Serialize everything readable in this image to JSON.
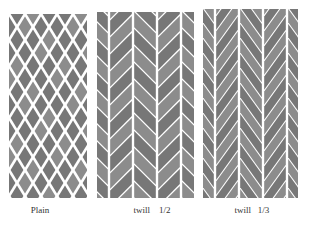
{
  "figure": {
    "panels": [
      {
        "id": "plain",
        "label": "Plain",
        "pattern": "diamond-lattice",
        "box": {
          "x": 9,
          "y": 14,
          "w": 78,
          "h": 184
        },
        "label_x": 40
      },
      {
        "id": "twill-1-2",
        "label": "twill    1/2",
        "pattern": "herringbone-short",
        "box": {
          "x": 97,
          "y": 12,
          "w": 97,
          "h": 186
        },
        "label_x": 152
      },
      {
        "id": "twill-1-3",
        "label": "twill   1/3",
        "pattern": "herringbone-long",
        "box": {
          "x": 203,
          "y": 9,
          "w": 95,
          "h": 189
        },
        "label_x": 252
      }
    ],
    "colors": {
      "background": "#ffffff",
      "fill_dark": "#777777",
      "fill_light": "#8c8c8c",
      "gap": "#ffffff",
      "label": "#333333"
    }
  }
}
